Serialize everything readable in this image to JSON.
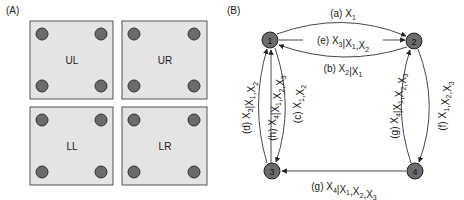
{
  "panel_a": {
    "label": "(A)",
    "squares": [
      {
        "id": "UL",
        "label": "UL"
      },
      {
        "id": "UR",
        "label": "UR"
      },
      {
        "id": "LL",
        "label": "LL"
      },
      {
        "id": "LR",
        "label": "LR"
      }
    ],
    "colors": {
      "square_fill": "#e4e4e4",
      "square_border": "#555555",
      "dot_fill": "#6a6a6a",
      "dot_stroke": "#333333"
    }
  },
  "panel_b": {
    "label": "(B)",
    "nodes": [
      {
        "id": "1",
        "label": "1"
      },
      {
        "id": "2",
        "label": "2"
      },
      {
        "id": "3",
        "label": "3"
      },
      {
        "id": "4",
        "label": "4"
      }
    ],
    "edges": {
      "a": {
        "from": "1",
        "to": "2",
        "tag": "(a)",
        "text": "X1"
      },
      "e": {
        "from": "1",
        "to": "2",
        "tag": "(e)",
        "text": "X3|X1,X2"
      },
      "b": {
        "from": "2",
        "to": "1",
        "tag": "(b)",
        "text": "X2|X1"
      },
      "c": {
        "from": "1",
        "to": "3",
        "tag": "(c)",
        "text": "X1,X2"
      },
      "d": {
        "from": "3",
        "to": "1",
        "tag": "(d)",
        "text": "X3|X1,X2"
      },
      "h": {
        "from": "3",
        "to": "1",
        "tag": "(h)",
        "text": "X4|X1,X2,X3"
      },
      "f": {
        "from": "2",
        "to": "4",
        "tag": "(f)",
        "text": "X1,X2,X3"
      },
      "g_up": {
        "from": "4",
        "to": "2",
        "tag": "(g)",
        "text": "X4|X1,X2,X3"
      },
      "g_bottom": {
        "from": "4",
        "to": "3",
        "tag": "(g)",
        "text": "X4|X1,X2,X3"
      }
    },
    "colors": {
      "node_fill": "#6b6b6b",
      "node_stroke": "#222222",
      "edge": "#333333"
    }
  }
}
